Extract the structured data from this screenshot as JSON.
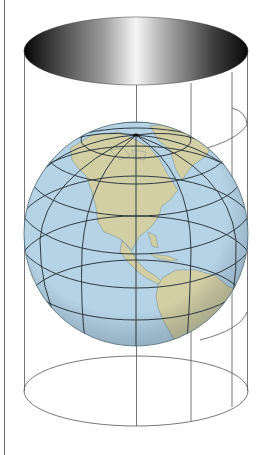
{
  "figure": {
    "title": "Cylindrical map projection: globe enclosed by a tangent cylinder",
    "colors": {
      "ocean": "#b6d3e6",
      "land": "#d3cfa5",
      "graticule": "#2f3a40",
      "cylinder_lines": "#555555",
      "cylinder_top_dark": "#0a0a0a",
      "cylinder_top_light": "#f4f4f4",
      "border": "#6a6a6a"
    },
    "elements": [
      "cylinder-top-shaded-ellipse",
      "cylinder-bottom-ellipse",
      "cylinder-vertical-lines",
      "globe",
      "graticule",
      "north-america",
      "south-america",
      "greenland"
    ]
  }
}
